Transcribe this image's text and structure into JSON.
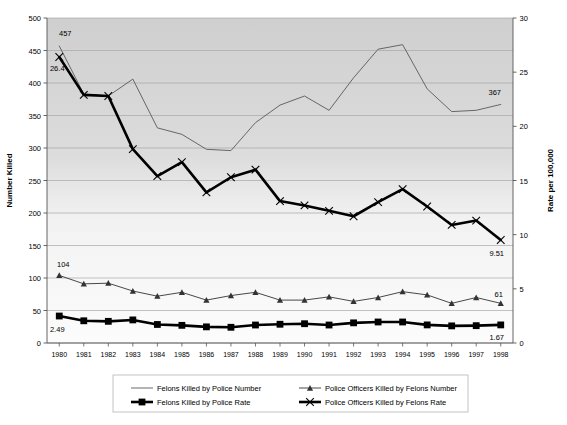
{
  "chart_data": {
    "type": "line",
    "title": "",
    "xlabel": "",
    "ylabel": "Number Killed",
    "y2label": "Rate per 100,000",
    "grid": true,
    "legend_position": "bottom",
    "categories": [
      "1980",
      "1981",
      "1982",
      "1983",
      "1984",
      "1985",
      "1986",
      "1987",
      "1988",
      "1989",
      "1990",
      "1991",
      "1992",
      "1993",
      "1994",
      "1995",
      "1996",
      "1997",
      "1998"
    ],
    "ylim": [
      0,
      500
    ],
    "yticks": [
      0,
      50,
      100,
      150,
      200,
      250,
      300,
      350,
      400,
      450,
      500
    ],
    "y2lim": [
      0,
      30
    ],
    "y2ticks": [
      0,
      5,
      10,
      15,
      20,
      25,
      30
    ],
    "series": [
      {
        "name": "Felons Killed by Police Number",
        "axis": "left",
        "marker": "none",
        "style": "thin-gray-line",
        "values": [
          457,
          383,
          380,
          406,
          331,
          321,
          298,
          296,
          339,
          366,
          380,
          358,
          408,
          452,
          459,
          391,
          356,
          358,
          367
        ]
      },
      {
        "name": "Felons Killed by Police Rate",
        "axis": "right",
        "marker": "square",
        "style": "thick-black-line",
        "values": [
          2.49,
          2.05,
          2.0,
          2.13,
          1.71,
          1.63,
          1.49,
          1.45,
          1.66,
          1.73,
          1.78,
          1.66,
          1.86,
          1.94,
          1.94,
          1.67,
          1.58,
          1.6,
          1.67
        ]
      },
      {
        "name": "Police Officers Killed by Felons Number",
        "axis": "left",
        "marker": "triangle",
        "style": "thin-black-line",
        "values": [
          104,
          91,
          92,
          80,
          72,
          78,
          66,
          73,
          78,
          66,
          66,
          71,
          64,
          70,
          79,
          74,
          61,
          70,
          61
        ]
      },
      {
        "name": "Police Officers Killed by Felons Rate",
        "axis": "right",
        "marker": "x",
        "style": "thick-black-line",
        "values": [
          26.4,
          22.9,
          22.8,
          17.9,
          15.4,
          16.7,
          13.9,
          15.3,
          16.0,
          13.1,
          12.7,
          12.2,
          11.7,
          13.0,
          14.2,
          12.6,
          10.9,
          11.3,
          9.51
        ]
      }
    ],
    "annotations": [
      {
        "text": "457",
        "series": "Felons Killed by Police Number",
        "point": "1980",
        "dx": 6,
        "dy": -10
      },
      {
        "text": "367",
        "series": "Felons Killed by Police Number",
        "point": "1998",
        "dx": -6,
        "dy": -9
      },
      {
        "text": "26.4",
        "series": "Police Officers Killed by Felons Rate",
        "point": "1980",
        "dx": -2,
        "dy": 14
      },
      {
        "text": "9.51",
        "series": "Police Officers Killed by Felons Rate",
        "point": "1998",
        "dx": -4,
        "dy": 16
      },
      {
        "text": "104",
        "series": "Police Officers Killed by Felons Number",
        "point": "1980",
        "dx": 4,
        "dy": -8
      },
      {
        "text": "61",
        "series": "Police Officers Killed by Felons Number",
        "point": "1998",
        "dx": -2,
        "dy": -6
      },
      {
        "text": "2.49",
        "series": "Felons Killed by Police Rate",
        "point": "1980",
        "dx": -2,
        "dy": 16
      },
      {
        "text": "1.67",
        "series": "Felons Killed by Police Rate",
        "point": "1998",
        "dx": -4,
        "dy": 15
      }
    ],
    "colors": {
      "thin_gray_line": "#595959",
      "thick_black_line": "#000000",
      "thin_black_line": "#333333",
      "plot_background_top": "#d2d2d2",
      "plot_background_bottom": "#fbfbfb",
      "gridline": "#a8a8a8",
      "axis": "#555555",
      "legend_border": "#b5b5b5"
    }
  }
}
